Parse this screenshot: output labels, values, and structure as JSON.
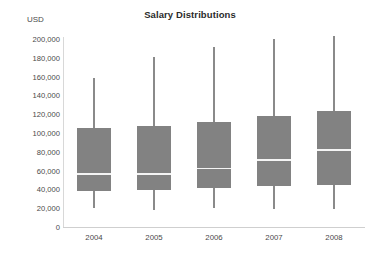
{
  "chart_data": {
    "type": "box",
    "title": "Salary Distributions",
    "xlabel": "",
    "ylabel": "USD",
    "ylim": [
      0,
      200000
    ],
    "grid": false,
    "legend": null,
    "categories": [
      "2004",
      "2005",
      "2006",
      "2007",
      "2008"
    ],
    "ytick_labels": [
      "200,000",
      "180,000",
      "160,000",
      "140,000",
      "120,000",
      "100,000",
      "80,000",
      "60,000",
      "40,000",
      "20,000",
      "0"
    ],
    "ytick_values": [
      200000,
      180000,
      160000,
      140000,
      120000,
      100000,
      80000,
      60000,
      40000,
      20000,
      0
    ],
    "series": [
      {
        "name": "Salary",
        "boxes": [
          {
            "category": "2004",
            "whisker_low": 20000,
            "q1": 38000,
            "median": 57000,
            "q3": 105000,
            "whisker_high": 158000
          },
          {
            "category": "2005",
            "whisker_low": 18000,
            "q1": 39000,
            "median": 57000,
            "q3": 107000,
            "whisker_high": 181000
          },
          {
            "category": "2006",
            "whisker_low": 20000,
            "q1": 41000,
            "median": 63000,
            "q3": 112000,
            "whisker_high": 192000
          },
          {
            "category": "2007",
            "whisker_low": 19000,
            "q1": 44000,
            "median": 72000,
            "q3": 118000,
            "whisker_high": 200000
          },
          {
            "category": "2008",
            "whisker_low": 19000,
            "q1": 45000,
            "median": 83000,
            "q3": 123000,
            "whisker_high": 203000
          }
        ]
      }
    ],
    "colors": {
      "box_fill": "#828282",
      "whisker": "#8a8a8a",
      "median": "#f4f4f4",
      "axis": "#cfcfcf",
      "text": "#4a4a4a",
      "title": "#2b2b2b",
      "background": "#ffffff"
    }
  }
}
